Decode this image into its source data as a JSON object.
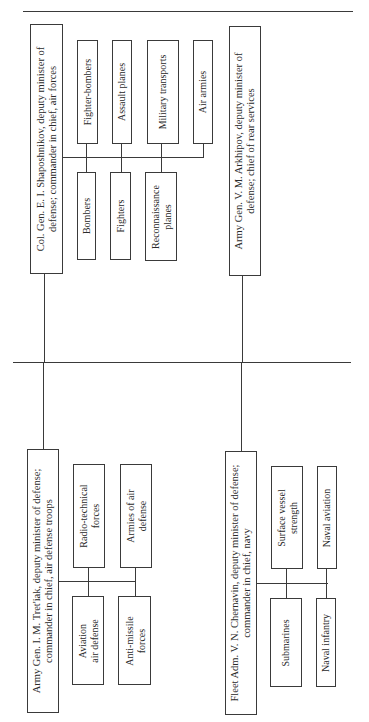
{
  "diagram": {
    "type": "org-chart",
    "orientation": "rotated-90-ccw",
    "colors": {
      "line": "#3a3a3a",
      "text": "#2a2a2a",
      "background": "#ffffff"
    },
    "branches": [
      {
        "id": "air-forces",
        "head": {
          "line1": "Col. Gen. E. I. Shaposhnikov, deputy minister of",
          "line2": "defense; commander in chief, air forces"
        },
        "units": [
          {
            "label": "Fighter-bombers",
            "line2": ""
          },
          {
            "label": "Assault planes",
            "line2": ""
          },
          {
            "label": "Military transports",
            "line2": ""
          },
          {
            "label": "Air armies",
            "line2": ""
          },
          {
            "label": "Bombers",
            "line2": ""
          },
          {
            "label": "Fighters",
            "line2": ""
          },
          {
            "label": "Reconnaissance",
            "line2": "planes"
          }
        ]
      },
      {
        "id": "rear-services",
        "head": {
          "line1": "Army Gen. V. M. Arkhipov, deputy minister of",
          "line2": "defense; chief of rear services"
        },
        "units": []
      },
      {
        "id": "air-defense",
        "head": {
          "line1": "Army Gen. I. M. Tret'iak, deputy minister of defense;",
          "line2": "commander in chief, air defense troops"
        },
        "units": [
          {
            "label": "Radio-technical",
            "line2": "forces"
          },
          {
            "label": "Armies of air",
            "line2": "defense"
          },
          {
            "label": "Aviation",
            "line2": "air defense"
          },
          {
            "label": "Anti-missile",
            "line2": "forces"
          }
        ]
      },
      {
        "id": "navy",
        "head": {
          "line1": "Fleet Adm. V. N. Chernavin, deputy minister of defense;",
          "line2": "commander in chief, navy"
        },
        "units": [
          {
            "label": "Surface vessel",
            "line2": "strength"
          },
          {
            "label": "Naval aviation",
            "line2": ""
          },
          {
            "label": "Submarines",
            "line2": ""
          },
          {
            "label": "Naval infantry",
            "line2": ""
          }
        ]
      }
    ]
  }
}
